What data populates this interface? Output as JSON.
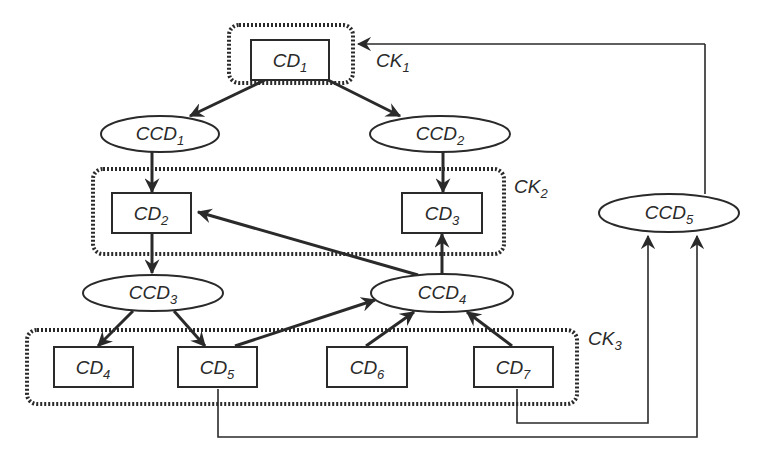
{
  "diagram": {
    "type": "dependency-graph",
    "colors": {
      "stroke": "#2a2a2a",
      "background": "#ffffff"
    },
    "groups": [
      {
        "id": "CK1",
        "base": "CK",
        "sub": "1",
        "members": [
          "CD1"
        ]
      },
      {
        "id": "CK2",
        "base": "CK",
        "sub": "2",
        "members": [
          "CD2",
          "CD3"
        ]
      },
      {
        "id": "CK3",
        "base": "CK",
        "sub": "3",
        "members": [
          "CD4",
          "CD5",
          "CD6",
          "CD7"
        ]
      }
    ],
    "rect_nodes": [
      {
        "id": "CD1",
        "base": "CD",
        "sub": "1"
      },
      {
        "id": "CD2",
        "base": "CD",
        "sub": "2"
      },
      {
        "id": "CD3",
        "base": "CD",
        "sub": "3"
      },
      {
        "id": "CD4",
        "base": "CD",
        "sub": "4"
      },
      {
        "id": "CD5",
        "base": "CD",
        "sub": "5"
      },
      {
        "id": "CD6",
        "base": "CD",
        "sub": "6"
      },
      {
        "id": "CD7",
        "base": "CD",
        "sub": "7"
      }
    ],
    "ellipse_nodes": [
      {
        "id": "CCD1",
        "base": "CCD",
        "sub": "1"
      },
      {
        "id": "CCD2",
        "base": "CCD",
        "sub": "2"
      },
      {
        "id": "CCD3",
        "base": "CCD",
        "sub": "3"
      },
      {
        "id": "CCD4",
        "base": "CCD",
        "sub": "4"
      },
      {
        "id": "CCD5",
        "base": "CCD",
        "sub": "5"
      }
    ],
    "edges": [
      {
        "from": "CD1",
        "to": "CCD1"
      },
      {
        "from": "CD1",
        "to": "CCD2"
      },
      {
        "from": "CCD1",
        "to": "CD2"
      },
      {
        "from": "CCD2",
        "to": "CD3"
      },
      {
        "from": "CD2",
        "to": "CCD3"
      },
      {
        "from": "CCD3",
        "to": "CD4"
      },
      {
        "from": "CCD3",
        "to": "CD5"
      },
      {
        "from": "CD5",
        "to": "CCD4"
      },
      {
        "from": "CD6",
        "to": "CCD4"
      },
      {
        "from": "CD7",
        "to": "CCD4"
      },
      {
        "from": "CCD4",
        "to": "CD2"
      },
      {
        "from": "CCD4",
        "to": "CD3"
      },
      {
        "from": "CD7",
        "to": "CCD5"
      },
      {
        "from": "CD5",
        "to": "CCD5"
      },
      {
        "from": "CCD5",
        "to": "CK1"
      }
    ]
  }
}
